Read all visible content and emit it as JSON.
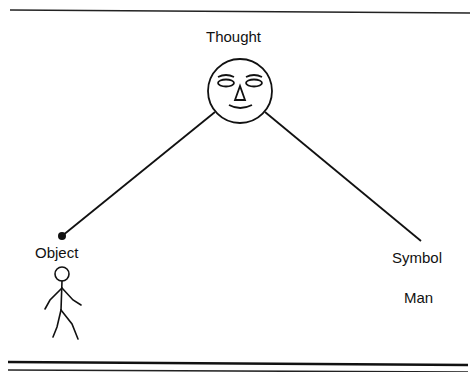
{
  "diagram": {
    "type": "semiotic-triangle",
    "nodes": {
      "top": {
        "label": "Thought",
        "icon": "face-icon"
      },
      "left": {
        "label": "Object",
        "icon": "stick-figure-icon"
      },
      "right": {
        "label": "Symbol",
        "sublabel": "Man"
      }
    },
    "edges": [
      {
        "from": "Thought",
        "to": "Object"
      },
      {
        "from": "Thought",
        "to": "Symbol"
      }
    ],
    "colors": {
      "ink": "#111111",
      "background": "#ffffff"
    }
  }
}
